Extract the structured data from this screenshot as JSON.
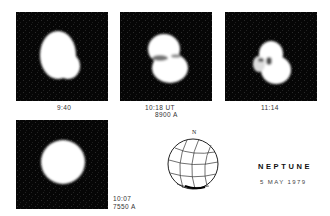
{
  "figure": {
    "title": "NEPTUNE",
    "date": "5 MAY 1979",
    "panels": [
      {
        "time": "9:40",
        "wavelength": ""
      },
      {
        "time": "10:18  UT",
        "wavelength": "8900 A"
      },
      {
        "time": "11:14",
        "wavelength": ""
      },
      {
        "time": "10:07",
        "wavelength": "7550 A"
      }
    ],
    "globe": {
      "north_label": "N"
    }
  }
}
